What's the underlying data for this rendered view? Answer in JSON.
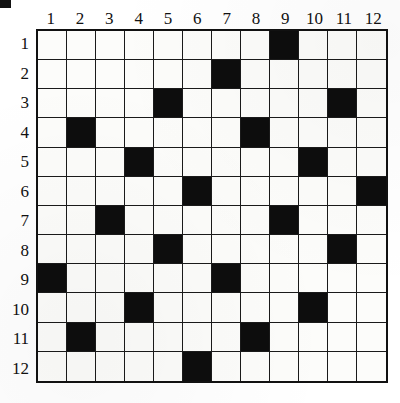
{
  "puzzle": {
    "type": "grid-puzzle",
    "rows": 12,
    "cols": 12,
    "column_headers": [
      "1",
      "2",
      "3",
      "4",
      "5",
      "6",
      "7",
      "8",
      "9",
      "10",
      "11",
      "12"
    ],
    "row_headers": [
      "1",
      "2",
      "3",
      "4",
      "5",
      "6",
      "7",
      "8",
      "9",
      "10",
      "11",
      "12"
    ],
    "colors": {
      "filled": "#0d0d0d",
      "empty": "#fcfcfa",
      "grid_line": "#1a1a1a",
      "border": "#111111",
      "label": "#111111"
    },
    "filled_cells": [
      {
        "row": 1,
        "col": 9
      },
      {
        "row": 2,
        "col": 7
      },
      {
        "row": 3,
        "col": 5
      },
      {
        "row": 3,
        "col": 11
      },
      {
        "row": 4,
        "col": 2
      },
      {
        "row": 4,
        "col": 8
      },
      {
        "row": 5,
        "col": 4
      },
      {
        "row": 5,
        "col": 10
      },
      {
        "row": 6,
        "col": 6
      },
      {
        "row": 6,
        "col": 12
      },
      {
        "row": 7,
        "col": 3
      },
      {
        "row": 7,
        "col": 9
      },
      {
        "row": 8,
        "col": 5
      },
      {
        "row": 8,
        "col": 11
      },
      {
        "row": 9,
        "col": 1
      },
      {
        "row": 9,
        "col": 7
      },
      {
        "row": 10,
        "col": 4
      },
      {
        "row": 10,
        "col": 10
      },
      {
        "row": 11,
        "col": 2
      },
      {
        "row": 11,
        "col": 8
      },
      {
        "row": 12,
        "col": 6
      }
    ],
    "grid_matrix": [
      [
        0,
        0,
        0,
        0,
        0,
        0,
        0,
        0,
        1,
        0,
        0,
        0
      ],
      [
        0,
        0,
        0,
        0,
        0,
        0,
        1,
        0,
        0,
        0,
        0,
        0
      ],
      [
        0,
        0,
        0,
        0,
        1,
        0,
        0,
        0,
        0,
        0,
        1,
        0
      ],
      [
        0,
        1,
        0,
        0,
        0,
        0,
        0,
        1,
        0,
        0,
        0,
        0
      ],
      [
        0,
        0,
        0,
        1,
        0,
        0,
        0,
        0,
        0,
        1,
        0,
        0
      ],
      [
        0,
        0,
        0,
        0,
        0,
        1,
        0,
        0,
        0,
        0,
        0,
        1
      ],
      [
        0,
        0,
        1,
        0,
        0,
        0,
        0,
        0,
        1,
        0,
        0,
        0
      ],
      [
        0,
        0,
        0,
        0,
        1,
        0,
        0,
        0,
        0,
        0,
        1,
        0
      ],
      [
        1,
        0,
        0,
        0,
        0,
        0,
        1,
        0,
        0,
        0,
        0,
        0
      ],
      [
        0,
        0,
        0,
        1,
        0,
        0,
        0,
        0,
        0,
        1,
        0,
        0
      ],
      [
        0,
        1,
        0,
        0,
        0,
        0,
        0,
        1,
        0,
        0,
        0,
        0
      ],
      [
        0,
        0,
        0,
        0,
        0,
        1,
        0,
        0,
        0,
        0,
        0,
        0
      ]
    ],
    "filled_count": 21,
    "corner_mark": "black-registration-mark"
  }
}
